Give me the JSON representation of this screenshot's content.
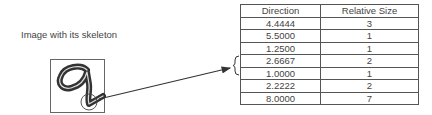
{
  "caption": "Image with its skeleton",
  "figure": {
    "digit_glyph": "9",
    "highlight": "circled-junction"
  },
  "table": {
    "headers": [
      "Direction",
      "Relative Size"
    ],
    "rows": [
      [
        "4.4444",
        "3"
      ],
      [
        "5.5000",
        "1"
      ],
      [
        "1.2500",
        "1"
      ],
      [
        "2.6667",
        "2"
      ],
      [
        "1.0000",
        "1"
      ],
      [
        "2.2222",
        "2"
      ],
      [
        "8.0000",
        "7"
      ]
    ],
    "bracketed_rows": [
      3,
      4
    ]
  }
}
